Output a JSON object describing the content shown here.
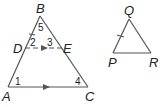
{
  "figure": {
    "triangle_abc": {
      "vertices": {
        "A": {
          "label": "A",
          "x": 8,
          "y": 87
        },
        "B": {
          "label": "B",
          "x": 40,
          "y": 16
        },
        "C": {
          "label": "C",
          "x": 88,
          "y": 87
        }
      },
      "segment_de": {
        "D": {
          "label": "D",
          "x": 25,
          "y": 48
        },
        "E": {
          "label": "E",
          "x": 62,
          "y": 48
        },
        "style": "dashed"
      },
      "angles": [
        {
          "label": "1",
          "x": 17,
          "y": 84
        },
        {
          "label": "2",
          "x": 30,
          "y": 46
        },
        {
          "label": "3",
          "x": 46,
          "y": 46
        },
        {
          "label": "4",
          "x": 76,
          "y": 84
        },
        {
          "label": "5",
          "x": 39,
          "y": 31
        }
      ],
      "parallel_markers": [
        "DE",
        "AC"
      ],
      "congruence_tick": "BD"
    },
    "triangle_pqr": {
      "vertices": {
        "P": {
          "label": "P",
          "x": 113,
          "y": 53
        },
        "Q": {
          "label": "Q",
          "x": 129,
          "y": 19
        },
        "R": {
          "label": "R",
          "x": 151,
          "y": 53
        }
      },
      "congruence_tick": "QP"
    },
    "line_color": "#555555"
  }
}
